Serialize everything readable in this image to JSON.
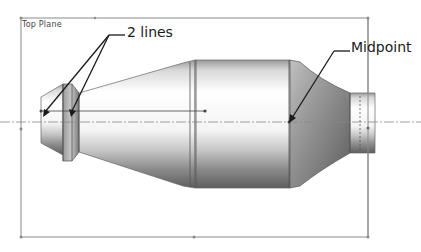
{
  "viewport": {
    "plane_label": "Top Plane",
    "plane_color": "#8a8a8a"
  },
  "annotations": {
    "two_lines": {
      "label": "2 lines",
      "target": "two vertical edges of the left ring"
    },
    "midpoint": {
      "label": "Midpoint",
      "target": "right edge of center cylinder on centerline"
    }
  },
  "model": {
    "description": "Revolved part: nozzle tip, ring, conical taper, center cylinder, cone, small shaft",
    "colors": {
      "body_light": "#f2f2f2",
      "body_dark": "#6e6e6e",
      "edge": "#555555",
      "centerline": "#888888",
      "arrow": "#1a1a1a"
    }
  }
}
